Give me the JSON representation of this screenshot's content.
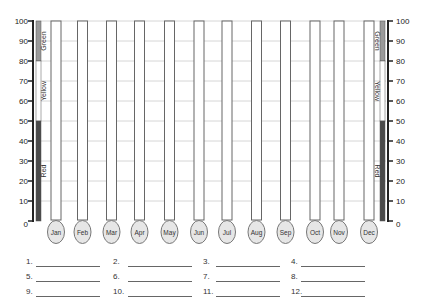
{
  "chart_data": {
    "type": "thermometer-bar",
    "title": "",
    "ylabel": "",
    "xlabel": "",
    "ylim": [
      0,
      100
    ],
    "y_ticks": [
      0,
      10,
      20,
      30,
      40,
      50,
      60,
      70,
      80,
      90,
      100
    ],
    "grid": true,
    "categories": [
      "Jan",
      "Feb",
      "Mar",
      "Apr",
      "May",
      "Jun",
      "Jul",
      "Aug",
      "Sep",
      "Oct",
      "Nov",
      "Dec"
    ],
    "values": [
      null,
      null,
      null,
      null,
      null,
      null,
      null,
      null,
      null,
      null,
      null,
      null
    ],
    "zones": [
      {
        "label": "Green",
        "from": 80,
        "to": 100,
        "color": "#9a9a9a"
      },
      {
        "label": "Yellow",
        "from": 50,
        "to": 80,
        "color": "#ffffff"
      },
      {
        "label": "Red",
        "from": 0,
        "to": 50,
        "color": "#4a4a4a"
      }
    ],
    "axes": [
      "left",
      "right"
    ],
    "legend": "none"
  },
  "colors": {
    "axis": "#222222",
    "grid": "#cccccc",
    "tube_outline": "#666666",
    "bulb_fill": "#e6e6e6",
    "bulb_outline": "#777777"
  },
  "blanks": [
    {
      "num": "1."
    },
    {
      "num": "2."
    },
    {
      "num": "3."
    },
    {
      "num": "4."
    },
    {
      "num": "5."
    },
    {
      "num": "6."
    },
    {
      "num": "7."
    },
    {
      "num": "8."
    },
    {
      "num": "9."
    },
    {
      "num": "10."
    },
    {
      "num": "11."
    },
    {
      "num": "12."
    }
  ]
}
